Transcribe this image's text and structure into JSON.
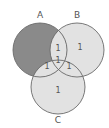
{
  "diagram": {
    "type": "venn-3",
    "sets": [
      {
        "id": "A",
        "label": "A",
        "cx": 40,
        "cy": 50,
        "r": 27
      },
      {
        "id": "B",
        "label": "B",
        "cx": 77,
        "cy": 50,
        "r": 27
      },
      {
        "id": "C",
        "label": "C",
        "cx": 58,
        "cy": 87,
        "r": 27
      }
    ],
    "regions": {
      "A_only": {
        "shaded": true,
        "value": ""
      },
      "B_only": {
        "value": "1"
      },
      "C_only": {
        "value": "1"
      },
      "A_and_B": {
        "value": "1"
      },
      "A_and_C": {
        "value": "1"
      },
      "B_and_C": {
        "value": "1"
      },
      "A_and_B_and_C": {
        "value": "1"
      }
    },
    "colors": {
      "shaded": "#8a8a8a",
      "light": "#e2e2e2",
      "stroke": "#6a6a6a",
      "background": "#ffffff"
    }
  }
}
